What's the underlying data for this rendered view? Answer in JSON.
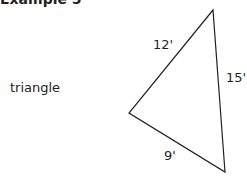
{
  "title": "Example 5",
  "shape_label": "triangle",
  "triangle": {
    "vertices": [
      [
        213,
        10
      ],
      [
        129,
        113
      ],
      [
        225,
        172
      ]
    ],
    "sides": {
      "top_left": "12'",
      "right": "15'",
      "bottom": "9'"
    },
    "stroke_color": "#231f20"
  }
}
